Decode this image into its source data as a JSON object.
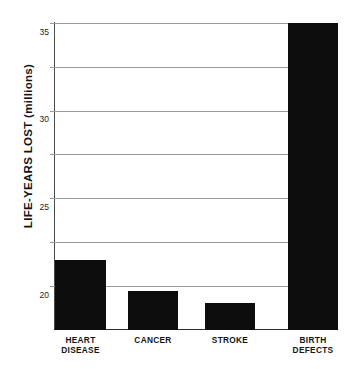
{
  "chart_data": {
    "type": "bar",
    "title": "",
    "xlabel": "",
    "ylabel": "LIFE-YEARS LOST (millions)",
    "categories": [
      "HEART\nDISEASE",
      "CANCER",
      "STROKE",
      "BIRTH\nDEFECTS"
    ],
    "values": [
      8,
      4.4,
      3.1,
      35
    ],
    "ylim": [
      0,
      36
    ],
    "yticks": [
      5,
      10,
      15,
      20,
      25,
      30,
      35
    ],
    "ytick_labels": [
      "5",
      "10",
      "15",
      "20",
      "25",
      "30",
      "35"
    ],
    "grid": true,
    "legend": "none",
    "bar_color": "#0d0d0d",
    "gridline_color": "#9a9a9a",
    "axis_color": "#2b2b2b",
    "background": "#ffffff"
  },
  "axis": {
    "y_title": "LIFE-YEARS LOST (millions)"
  }
}
